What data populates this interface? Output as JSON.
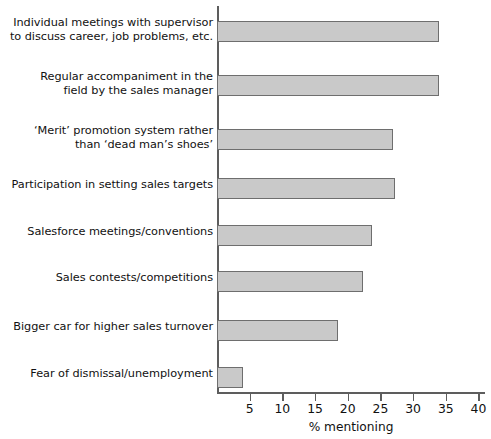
{
  "chart_data": {
    "type": "bar",
    "orientation": "horizontal",
    "title": "",
    "xlabel": "% mentioning",
    "ylabel": "",
    "xlim": [
      0,
      41
    ],
    "xticks": [
      5,
      10,
      15,
      20,
      25,
      30,
      35,
      40
    ],
    "grid": false,
    "legend": false,
    "bar_color": "#c9c9c9",
    "bar_border_color": "#6e6e6e",
    "axis_color": "#5d5d5d",
    "categories": [
      "Individual meetings with supervisor\nto discuss career, job problems, etc.",
      "Regular accompaniment in the\nfield by the sales manager",
      "‘Merit’ promotion system rather\nthan ‘dead man’s shoes’",
      "Participation in setting sales targets",
      "Salesforce meetings/conventions",
      "Sales contests/competitions",
      "Bigger car for higher sales turnover",
      "Fear of dismissal/unemployment"
    ],
    "values": [
      34,
      34,
      27,
      27.3,
      23.7,
      22.4,
      18.5,
      4
    ]
  },
  "axis": {
    "x_title": "% mentioning",
    "tick_labels": [
      "5",
      "10",
      "15",
      "20",
      "25",
      "30",
      "35",
      "40"
    ]
  }
}
